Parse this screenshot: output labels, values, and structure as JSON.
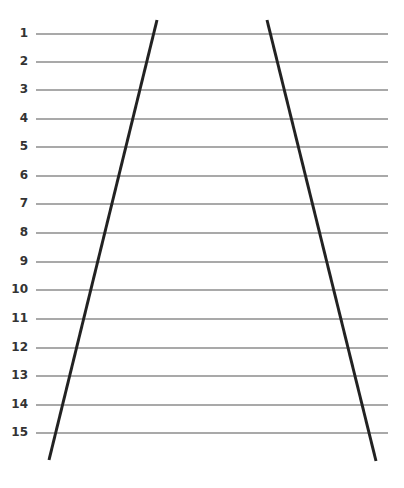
{
  "diagram": {
    "type": "ruled-lines-with-converging-diagonals",
    "colors": {
      "background": "#ffffff",
      "rule": "#555555",
      "diagonal": "#222222",
      "label": "#333333"
    },
    "rules": {
      "x_start": 36,
      "x_end": 388,
      "rows": [
        {
          "label": "1",
          "y": 34
        },
        {
          "label": "2",
          "y": 62
        },
        {
          "label": "3",
          "y": 90
        },
        {
          "label": "4",
          "y": 119
        },
        {
          "label": "5",
          "y": 147
        },
        {
          "label": "6",
          "y": 176
        },
        {
          "label": "7",
          "y": 204
        },
        {
          "label": "8",
          "y": 233
        },
        {
          "label": "9",
          "y": 262
        },
        {
          "label": "10",
          "y": 290
        },
        {
          "label": "11",
          "y": 319
        },
        {
          "label": "12",
          "y": 348
        },
        {
          "label": "13",
          "y": 376
        },
        {
          "label": "14",
          "y": 405
        },
        {
          "label": "15",
          "y": 433
        }
      ]
    },
    "diagonals": [
      {
        "name": "left-diagonal",
        "x1": 157,
        "y1": 20,
        "x2": 49,
        "y2": 460
      },
      {
        "name": "right-diagonal",
        "x1": 267,
        "y1": 20,
        "x2": 376,
        "y2": 461
      }
    ]
  }
}
